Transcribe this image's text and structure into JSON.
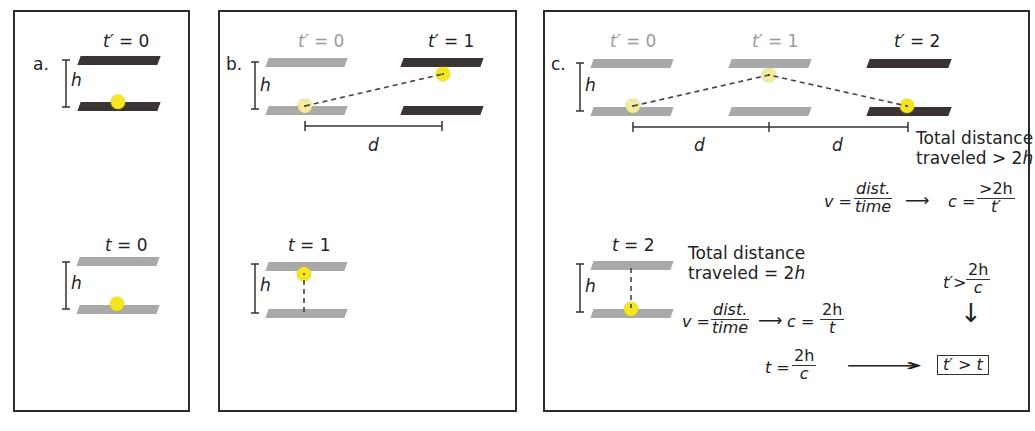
{
  "panels": {
    "a": {
      "label": "a.",
      "top_frame": {
        "time_label_var": "t′",
        "time_label_rest": " = 0",
        "height_label": "h"
      },
      "bottom_frame": {
        "time_label_var": "t",
        "time_label_rest": " = 0",
        "height_label": "h"
      }
    },
    "b": {
      "label": "b.",
      "top_frame": {
        "time0_var": "t′",
        "time0_rest": " = 0",
        "time1_var": "t′",
        "time1_rest": " = 1",
        "height_label": "h",
        "distance_label": "d"
      },
      "bottom_frame": {
        "time_label_var": "t",
        "time_label_rest": " = 1",
        "height_label": "h"
      }
    },
    "c": {
      "label": "c.",
      "top_frame": {
        "time0_var": "t′",
        "time0_rest": " = 0",
        "time1_var": "t′",
        "time1_rest": " = 1",
        "time2_var": "t′",
        "time2_rest": " = 2",
        "height_label": "h",
        "distance_label_1": "d",
        "distance_label_2": "d",
        "total_line1": "Total distance",
        "total_line2_text": "traveled > 2",
        "total_line2_var": "h"
      },
      "bottom_frame": {
        "time_label_var": "t",
        "time_label_rest": " = 2",
        "height_label": "h",
        "total_line1": "Total distance",
        "total_line2_text": "traveled = 2",
        "total_line2_var": "h"
      },
      "equations": {
        "eq1_lhs": "v =",
        "eq1_num": "dist.",
        "eq1_den": "time",
        "eq1_arrow": "⟶",
        "eq1_c": "c =",
        "eq1_c_num": "2h",
        "eq1_c_den": "t",
        "eq2_lhs": "v =",
        "eq2_num": "dist.",
        "eq2_den": "time",
        "eq2_arrow": "⟶",
        "eq2_c": "c =",
        "eq2_c_num": ">2h",
        "eq2_c_den": "t′",
        "eq3_lhs": "t′>",
        "eq3_num": "2h",
        "eq3_den": "c",
        "eq4_lhs": "t =",
        "eq4_num": "2h",
        "eq4_den": "c",
        "down_arrow": "↓",
        "long_arrow": "⟶",
        "conclusion": "t′ > t"
      }
    }
  },
  "colors": {
    "mirror_current": "#3a3434",
    "mirror_past": "#a9a9a9",
    "photon": "#f5e61e",
    "frame_border": "#2b2b2b"
  }
}
